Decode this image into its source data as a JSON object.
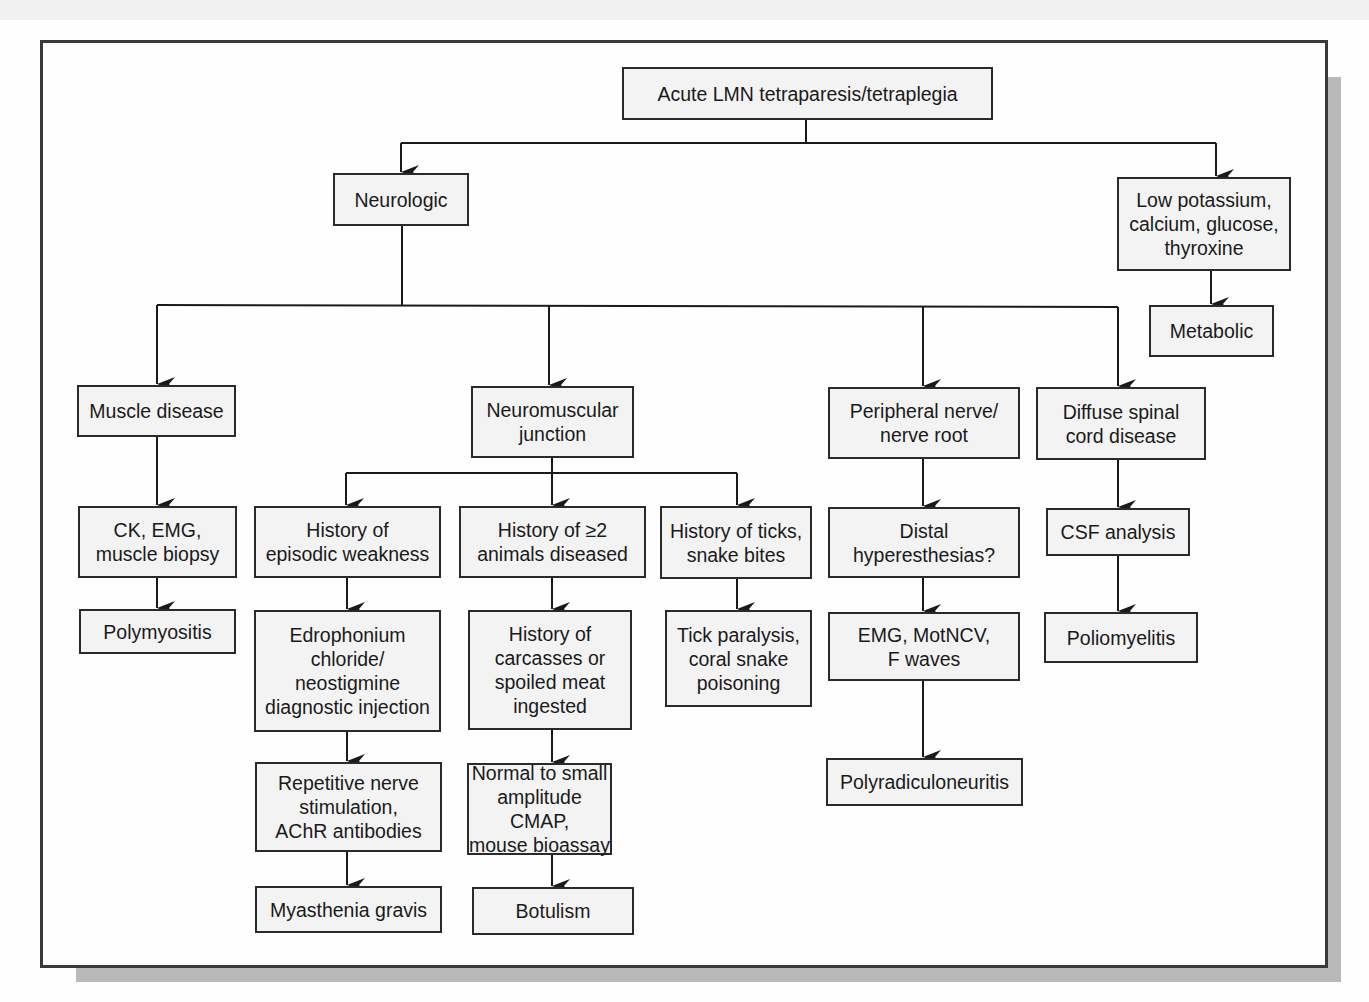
{
  "diagram": {
    "type": "flowchart",
    "title": "Acute LMN tetraparesis/tetraplegia",
    "nodes": {
      "root": "Acute LMN tetraparesis/tetraplegia",
      "neurologic": "Neurologic",
      "low_electrolytes": "Low potassium,\ncalcium, glucose,\nthyroxine",
      "metabolic": "Metabolic",
      "muscle_disease": "Muscle disease",
      "nmj": "Neuromuscular\njunction",
      "peripheral_nerve": "Peripheral nerve/\nnerve root",
      "spinal_cord": "Diffuse spinal\ncord disease",
      "ck_emg": "CK, EMG,\nmuscle biopsy",
      "hx_episodic": "History of\nepisodic weakness",
      "hx_multiple": "History of ≥2\nanimals diseased",
      "hx_ticks": "History of ticks,\nsnake bites",
      "distal_hyper": "Distal\nhyperesthesias?",
      "csf": "CSF analysis",
      "polymyositis": "Polymyositis",
      "edrophonium": "Edrophonium\nchloride/\nneostigmine\ndiagnostic injection",
      "carcasses": "History of\ncarcasses or\nspoiled meat\ningested",
      "tick_paralysis": "Tick paralysis,\ncoral snake\npoisoning",
      "emg_motncv": "EMG, MotNCV,\nF waves",
      "poliomyelitis": "Poliomyelitis",
      "repetitive": "Repetitive nerve\nstimulation,\nAChR antibodies",
      "normal_cmap": "Normal to small\namplitude CMAP,\nmouse bioassay",
      "polyradiculoneuritis": "Polyradiculoneuritis",
      "myasthenia": "Myasthenia gravis",
      "botulism": "Botulism"
    },
    "edges": [
      [
        "root",
        "neurologic"
      ],
      [
        "root",
        "low_electrolytes"
      ],
      [
        "low_electrolytes",
        "metabolic"
      ],
      [
        "neurologic",
        "muscle_disease"
      ],
      [
        "neurologic",
        "nmj"
      ],
      [
        "neurologic",
        "peripheral_nerve"
      ],
      [
        "neurologic",
        "spinal_cord"
      ],
      [
        "muscle_disease",
        "ck_emg"
      ],
      [
        "ck_emg",
        "polymyositis"
      ],
      [
        "nmj",
        "hx_episodic"
      ],
      [
        "nmj",
        "hx_multiple"
      ],
      [
        "nmj",
        "hx_ticks"
      ],
      [
        "hx_episodic",
        "edrophonium"
      ],
      [
        "edrophonium",
        "repetitive"
      ],
      [
        "repetitive",
        "myasthenia"
      ],
      [
        "hx_multiple",
        "carcasses"
      ],
      [
        "carcasses",
        "normal_cmap"
      ],
      [
        "normal_cmap",
        "botulism"
      ],
      [
        "hx_ticks",
        "tick_paralysis"
      ],
      [
        "peripheral_nerve",
        "distal_hyper"
      ],
      [
        "distal_hyper",
        "emg_motncv"
      ],
      [
        "emg_motncv",
        "polyradiculoneuritis"
      ],
      [
        "spinal_cord",
        "csf"
      ],
      [
        "csf",
        "poliomyelitis"
      ]
    ]
  },
  "colors": {
    "box_fill": "#f3f3f3",
    "line": "#1a1a1a",
    "frame": "#3a3a3a",
    "shadow": "#b9b9b9"
  }
}
